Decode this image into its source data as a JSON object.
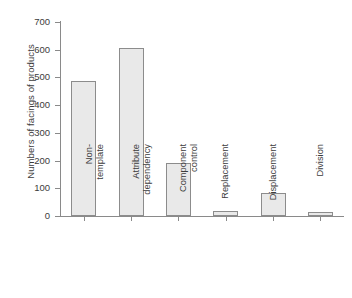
{
  "chart_data": {
    "type": "bar",
    "title": "",
    "xlabel": "",
    "ylabel": "Numbers of facings of products",
    "categories": [
      "Non-\ntemplate",
      "Attribute\ndependency",
      "Component\ncontrol",
      "Replacement",
      "Displacement",
      "Division"
    ],
    "values": [
      487,
      606,
      191,
      18,
      83,
      15
    ],
    "ylim": [
      0,
      700
    ],
    "yticks": [
      0,
      100,
      200,
      300,
      400,
      500,
      600,
      700
    ],
    "ytick_labels": [
      "0",
      "100",
      "200",
      "300",
      "400",
      "500",
      "600",
      "700"
    ],
    "grid": false,
    "legend": null,
    "bar_fill_color": "#e9e9e9",
    "bar_edge_color": "#8c8c8c",
    "axis_color": "#8a8a8a",
    "text_color": "#3c3c3c",
    "background_color": "#ffffff"
  }
}
